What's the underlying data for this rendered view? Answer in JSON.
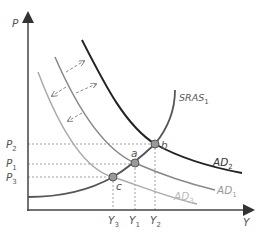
{
  "diagram": {
    "axes": {
      "y_label": "P",
      "x_label": "Y"
    },
    "price_levels": [
      {
        "base": "P",
        "sub": "2"
      },
      {
        "base": "P",
        "sub": "1"
      },
      {
        "base": "P",
        "sub": "3"
      }
    ],
    "output_levels": [
      {
        "base": "Y",
        "sub": "3"
      },
      {
        "base": "Y",
        "sub": "1"
      },
      {
        "base": "Y",
        "sub": "2"
      }
    ],
    "curves": {
      "sras": {
        "base": "SRAS",
        "sub": "1"
      },
      "ad2": {
        "base": "AD",
        "sub": "2"
      },
      "ad1": {
        "base": "AD",
        "sub": "1"
      },
      "ad3": {
        "base": "AD",
        "sub": "3"
      }
    },
    "points": {
      "a": "a",
      "b": "b",
      "c": "c"
    },
    "colors": {
      "axis": "#444444",
      "ad2": "#222222",
      "ad1": "#888888",
      "ad3": "#aaaaaa",
      "sras": "#555555",
      "point_fill": "#999999",
      "dashed": "#777777"
    }
  }
}
